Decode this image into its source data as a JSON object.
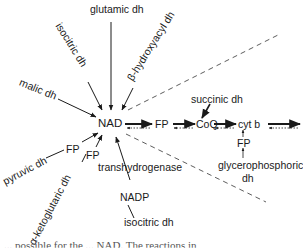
{
  "diagram": {
    "center_node": "NAD",
    "inputs": {
      "glutamic": "glutamic dh",
      "isocitric_top": "isocitric dh",
      "hydroxyacyl": "β-hydroxyacyl dh",
      "malic": "malic dh",
      "pyruvic": "pyruvic dh",
      "ketoglutaric": "α-ketoglutaric dh",
      "transhydrogenase": "transhydrogenase",
      "nadp": "NADP",
      "isocitric_bottom": "isocitric dh"
    },
    "fp_labels": {
      "pyruvic_fp": "FP",
      "keto_fp": "FP",
      "chain_fp": "FP",
      "glycero_fp": "FP"
    },
    "chain": {
      "fp": "FP",
      "coq": "CoQ",
      "cytb": "cyt b",
      "succinic": "succinic dh",
      "glycerophosphoric_line1": "glycerophosphoric",
      "glycerophosphoric_line2": "dh"
    },
    "caption_fragment": "... possible for the ... NAD. The reactions in"
  },
  "colors": {
    "ink": "#1a1a1a",
    "background": "#ffffff"
  }
}
